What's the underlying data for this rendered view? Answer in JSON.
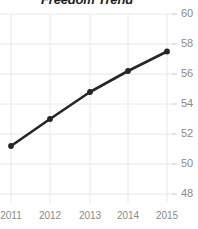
{
  "chart_data": {
    "type": "line",
    "title": "Freedom Trend",
    "xlabel": "",
    "ylabel": "",
    "categories": [
      "2011",
      "2012",
      "2013",
      "2014",
      "2015"
    ],
    "x": [
      2011,
      2012,
      2013,
      2014,
      2015
    ],
    "values": [
      51.2,
      53.0,
      54.8,
      56.2,
      57.5
    ],
    "series": [
      {
        "name": "Freedom Trend",
        "values": [
          51.2,
          53.0,
          54.8,
          56.2,
          57.5
        ]
      }
    ],
    "ylim": [
      48,
      60
    ],
    "y_ticks": [
      48,
      50,
      52,
      54,
      56,
      58,
      60
    ],
    "y_tick_labels": [
      "48",
      "50",
      "52",
      "54",
      "56",
      "58",
      "60"
    ],
    "x_tick_labels": [
      "2011",
      "2012",
      "2013",
      "2014",
      "2015"
    ],
    "grid": true,
    "grid_color": "#e8e8e8",
    "legend": false,
    "legend_position": "none",
    "line_color": "#262626",
    "marker": "circle",
    "marker_color": "#262626",
    "y_axis_side": "right",
    "tick_label_color": "#8a8a8a",
    "title_color": "#1d1d1d",
    "background": "#ffffff"
  }
}
